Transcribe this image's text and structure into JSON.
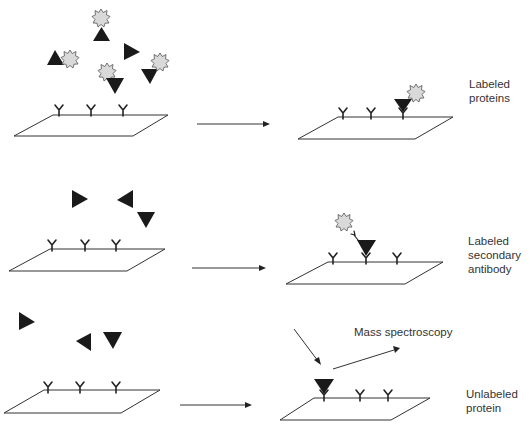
{
  "diagram": {
    "rows": [
      {
        "id": "row-1",
        "label_lines": [
          "Labeled",
          "proteins"
        ],
        "caption": "Labeled proteins"
      },
      {
        "id": "row-2",
        "label_lines": [
          "Labeled",
          "secondary",
          "antibody"
        ],
        "caption": "Labeled secondary antibody"
      },
      {
        "id": "row-3",
        "label_lines": [
          "Unlabeled",
          "protein"
        ],
        "caption": "Unlabeled protein",
        "detection_label": "Mass spectroscopy"
      }
    ],
    "legend": {
      "capture_antibody_glyph": "Y",
      "protein_shape": "black triangle",
      "label_shape": "grey starburst"
    },
    "colors": {
      "protein": "#1a1a1a",
      "label": "#d9d9d9",
      "line": "#333333",
      "background": "#ffffff"
    }
  }
}
